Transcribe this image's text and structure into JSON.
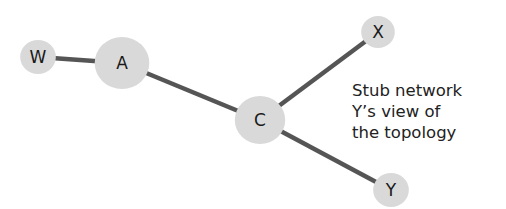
{
  "diagram": {
    "type": "network-topology",
    "colors": {
      "edge": "#555555",
      "node_fill": "#d9d9d9",
      "text": "#1a1a1a"
    },
    "nodes": [
      {
        "id": "W",
        "label": "W",
        "x": 38,
        "y": 57,
        "r": 17
      },
      {
        "id": "A",
        "label": "A",
        "x": 122,
        "y": 63,
        "r": 26
      },
      {
        "id": "C",
        "label": "C",
        "x": 260,
        "y": 120,
        "r": 24
      },
      {
        "id": "X",
        "label": "X",
        "x": 378,
        "y": 32,
        "r": 16
      },
      {
        "id": "Y",
        "label": "Y",
        "x": 391,
        "y": 190,
        "r": 17
      }
    ],
    "edges": [
      {
        "from": "W",
        "to": "A"
      },
      {
        "from": "A",
        "to": "C"
      },
      {
        "from": "C",
        "to": "X"
      },
      {
        "from": "C",
        "to": "Y"
      }
    ],
    "caption": {
      "lines": [
        "Stub network",
        "Y’s view of",
        "the topology"
      ]
    }
  }
}
